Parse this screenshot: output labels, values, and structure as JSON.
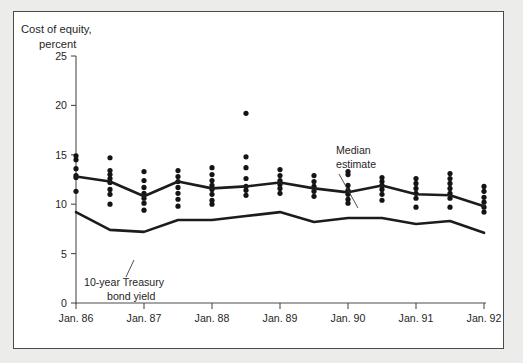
{
  "figure": {
    "background_color": "#ececeb",
    "panel_color": "#ffffff",
    "border_color": "#4b4b4b"
  },
  "axis_title_line1": "Cost of equity,",
  "axis_title_line2": "percent",
  "annotations": {
    "median": {
      "line1": "Median",
      "line2": "estimate"
    },
    "treasury": {
      "line1": "10-year Treasury",
      "line2": "bond yield"
    }
  },
  "chart_data": {
    "type": "scatter",
    "title": "Cost of equity, percent",
    "xlabel": "",
    "ylabel": "Cost of equity, percent",
    "ylim": [
      0,
      25
    ],
    "yticks": [
      0,
      5,
      10,
      15,
      20,
      25
    ],
    "ytick_labels": [
      "0",
      "5",
      "10",
      "15",
      "20",
      "25"
    ],
    "grid": false,
    "legend_position": "inline-annotation",
    "xtick_labels": [
      "Jan. 86",
      "Jan. 87",
      "Jan. 88",
      "Jan. 89",
      "Jan. 90",
      "Jan. 91",
      "Jan. 92"
    ],
    "xtick_positions": [
      0,
      2,
      4,
      6,
      8,
      10,
      12
    ],
    "x_positions": [
      0,
      1,
      2,
      3,
      4,
      5,
      6,
      7,
      8,
      9,
      10,
      11,
      12
    ],
    "x_period_labels": [
      "Jan. 86",
      "Jul. 86",
      "Jan. 87",
      "Jul. 87",
      "Jan. 88",
      "Jul. 88",
      "Jan. 89",
      "Jul. 89",
      "Jan. 90",
      "Jul. 90",
      "Jan. 91",
      "Jul. 91",
      "Jan. 92"
    ],
    "series": [
      {
        "name": "Median estimate",
        "type": "line",
        "color": "#1c1c1c",
        "values": [
          12.8,
          12.3,
          10.8,
          12.3,
          11.6,
          11.8,
          12.2,
          11.6,
          11.2,
          11.9,
          11.0,
          10.9,
          9.8
        ]
      },
      {
        "name": "10-year Treasury bond yield",
        "type": "line",
        "color": "#1c1c1c",
        "values": [
          9.2,
          7.4,
          7.2,
          8.4,
          8.4,
          8.8,
          9.2,
          8.2,
          8.6,
          8.6,
          8.0,
          8.3,
          7.1
        ]
      },
      {
        "name": "Individual estimates",
        "type": "scatter",
        "color": "#141414",
        "points": [
          {
            "x": 0,
            "values": [
              14.9,
              14.5,
              13.6,
              12.9,
              12.7,
              11.3
            ]
          },
          {
            "x": 1,
            "values": [
              14.7,
              13.4,
              13.0,
              12.6,
              12.2,
              11.5,
              11.0,
              10.0
            ]
          },
          {
            "x": 2,
            "values": [
              13.3,
              12.4,
              11.7,
              11.1,
              10.6,
              10.1,
              9.4
            ]
          },
          {
            "x": 3,
            "values": [
              13.4,
              12.8,
              12.3,
              11.7,
              11.1,
              10.5,
              9.8
            ]
          },
          {
            "x": 4,
            "values": [
              13.7,
              13.0,
              12.4,
              11.9,
              11.5,
              11.0,
              10.4,
              10.0
            ]
          },
          {
            "x": 5,
            "values": [
              19.2,
              14.8,
              13.7,
              12.6,
              11.8,
              11.4,
              10.9
            ]
          },
          {
            "x": 6,
            "values": [
              13.5,
              12.9,
              12.4,
              12.0,
              11.6,
              11.1
            ]
          },
          {
            "x": 7,
            "values": [
              12.9,
              12.3,
              11.8,
              11.3,
              10.8
            ]
          },
          {
            "x": 8,
            "values": [
              13.3,
              13.0,
              11.9,
              11.4,
              11.0,
              10.5,
              10.1
            ]
          },
          {
            "x": 9,
            "values": [
              12.7,
              12.3,
              11.9,
              11.5,
              11.0,
              10.4
            ]
          },
          {
            "x": 10,
            "values": [
              12.6,
              12.1,
              11.6,
              11.1,
              10.6,
              9.7
            ]
          },
          {
            "x": 11,
            "values": [
              13.1,
              12.6,
              12.1,
              11.6,
              11.1,
              10.6,
              9.7
            ]
          },
          {
            "x": 12,
            "values": [
              11.8,
              11.3,
              10.7,
              10.2,
              9.7,
              9.2
            ]
          }
        ]
      }
    ]
  }
}
